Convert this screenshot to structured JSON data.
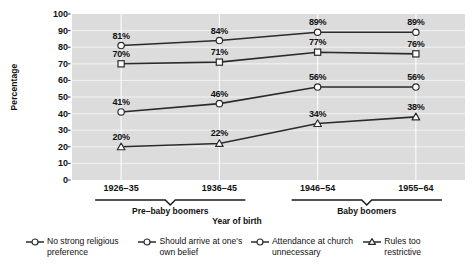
{
  "chart_data": {
    "type": "line",
    "title": "",
    "xlabel": "Year of birth",
    "ylabel": "Percentage",
    "ylim": [
      0,
      100
    ],
    "grid": true,
    "legend_position": "bottom",
    "categories": [
      "1926–35",
      "1936–45",
      "1946–54",
      "1955–64"
    ],
    "y_ticks": [
      0,
      10,
      20,
      30,
      40,
      50,
      60,
      70,
      80,
      90,
      100
    ],
    "series": [
      {
        "name": "No strong religious preference",
        "marker": "circle",
        "values": [
          81,
          84,
          89,
          89
        ],
        "labels": [
          "81%",
          "84%",
          "89%",
          "89%"
        ]
      },
      {
        "name": "Should arrive at one's own belief",
        "marker": "square",
        "values": [
          70,
          71,
          77,
          76
        ],
        "labels": [
          "70%",
          "71%",
          "77%",
          "76%"
        ]
      },
      {
        "name": "Attendance at church unnecessary",
        "marker": "circle",
        "values": [
          41,
          46,
          56,
          56
        ],
        "labels": [
          "41%",
          "46%",
          "56%",
          "56%"
        ]
      },
      {
        "name": "Rules too restrictive",
        "marker": "triangle",
        "values": [
          20,
          22,
          34,
          38
        ],
        "labels": [
          "20%",
          "22%",
          "34%",
          "38%"
        ]
      }
    ],
    "groups": [
      {
        "label": "Pre–baby boomers",
        "categories": [
          "1926–35",
          "1936–45"
        ]
      },
      {
        "label": "Baby boomers",
        "categories": [
          "1946–54",
          "1955–64"
        ]
      }
    ],
    "colors": {
      "line": "#2b2b2b",
      "plot_background": "#dcdcdc",
      "gridline": "#f2f2f2",
      "marker_fill": "#ffffff",
      "text": "#111111"
    }
  },
  "legend": {
    "items": [
      {
        "label": "No strong religious preference",
        "marker": "circle"
      },
      {
        "label": "Should arrive at one's own belief",
        "marker": "circle"
      },
      {
        "label": "Attendance at church unnecessary",
        "marker": "circle"
      },
      {
        "label": "Rules too restrictive",
        "marker": "triangle"
      }
    ]
  }
}
